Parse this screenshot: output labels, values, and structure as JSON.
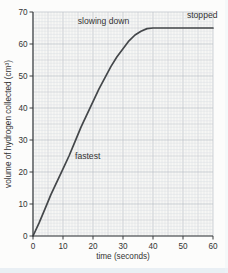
{
  "figure": {
    "page_bg": "#fcfcfb",
    "plot_bg": "#f7f7f5",
    "bottom_band_color": "#e9eff4",
    "right_band_color": "#eef3f7"
  },
  "chart_data": {
    "type": "line",
    "title": "",
    "xlabel": "time (seconds)",
    "ylabel": "volume of hydrogen collected (cm³)",
    "xlim": [
      0,
      60
    ],
    "ylim": [
      0,
      70
    ],
    "x_ticks": [
      0,
      10,
      20,
      30,
      40,
      50,
      60
    ],
    "y_ticks": [
      0,
      10,
      20,
      30,
      40,
      50,
      60,
      70
    ],
    "grid": {
      "on": true,
      "minor_step": 1,
      "major_step": 5,
      "labeled_step": 10
    },
    "legend": "none",
    "series": [
      {
        "name": "volume of hydrogen collected",
        "points": [
          [
            0,
            0
          ],
          [
            2,
            4
          ],
          [
            4,
            8.5
          ],
          [
            6,
            13
          ],
          [
            8,
            17
          ],
          [
            10,
            21
          ],
          [
            12,
            25
          ],
          [
            14,
            29.5
          ],
          [
            16,
            34
          ],
          [
            18,
            38
          ],
          [
            20,
            42
          ],
          [
            22,
            46
          ],
          [
            24,
            49.5
          ],
          [
            26,
            53
          ],
          [
            28,
            56
          ],
          [
            30,
            58.5
          ],
          [
            32,
            61
          ],
          [
            34,
            62.8
          ],
          [
            36,
            64
          ],
          [
            38,
            64.8
          ],
          [
            40,
            65
          ],
          [
            45,
            65
          ],
          [
            50,
            65
          ],
          [
            55,
            65
          ],
          [
            60,
            65
          ]
        ]
      }
    ],
    "annotations": [
      {
        "text": "fastest",
        "t": 14,
        "v": 24,
        "anchor": "start"
      },
      {
        "text": "slowing down",
        "t": 23.5,
        "v": 66.3,
        "anchor": "middle"
      },
      {
        "text": "stopped",
        "t": 61.5,
        "v": 68.2,
        "anchor": "end"
      }
    ],
    "colors": {
      "curve": "#44474a",
      "axis": "#3a3d3f",
      "grid_minor": "#dadde1",
      "grid_major": "#c6cbd1",
      "grid_labeled": "#b9bfc7",
      "text": "#333333"
    }
  }
}
